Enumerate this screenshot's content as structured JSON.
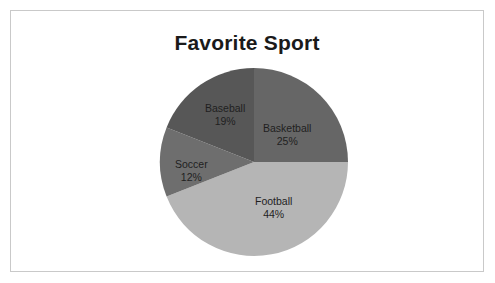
{
  "chart_data": {
    "type": "pie",
    "title": "Favorite Sport",
    "categories": [
      "Basketball",
      "Football",
      "Soccer",
      "Baseball"
    ],
    "values": [
      25,
      44,
      12,
      19
    ],
    "value_suffix": "%",
    "total": 100,
    "start_angle_deg": 0,
    "direction": "clockwise",
    "legend": "none",
    "grid": false,
    "slices": [
      {
        "label": "Basketball",
        "value": 25,
        "display_value": "25%",
        "color": "#666666",
        "label_x": 104,
        "label_y": 55
      },
      {
        "label": "Football",
        "value": 44,
        "display_value": "44%",
        "color": "#b5b5b5",
        "label_x": 96,
        "label_y": 128
      },
      {
        "label": "Soccer",
        "value": 12,
        "display_value": "12%",
        "color": "#6e6e6e",
        "label_x": 16,
        "label_y": 91
      },
      {
        "label": "Baseball",
        "value": 19,
        "display_value": "19%",
        "color": "#575757",
        "label_x": 46,
        "label_y": 35
      }
    ]
  },
  "frame": {
    "border_color": "#c9c9c9",
    "background": "#ffffff"
  }
}
